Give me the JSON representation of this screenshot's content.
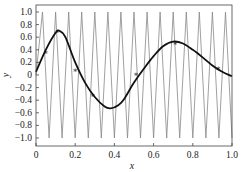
{
  "chart_data": {
    "type": "line",
    "title": "",
    "xlabel": "x",
    "ylabel": "y",
    "xlim": [
      0,
      1.0
    ],
    "ylim": [
      -1.1,
      1.1
    ],
    "grid": false,
    "legend": null,
    "xticks": [
      "0",
      "0.2",
      "0.4",
      "0.6",
      "0.8",
      "1.0"
    ],
    "yticks": [
      "1.0",
      "0.8",
      "0.6",
      "0.4",
      "0.2",
      "0",
      "-0.2",
      "-0.4",
      "-0.6",
      "-0.8",
      "-1.0"
    ],
    "series": [
      {
        "name": "zigzag (gray)",
        "style": "thin gray line",
        "color": "#888888",
        "description": "triangle wave oscillating between -1 and 1, about 15 cycles over [0,1]",
        "cycles": 15,
        "amplitude": 1.0
      },
      {
        "name": "smooth curve (black)",
        "style": "thick black line",
        "color": "#111111",
        "x": [
          0.0,
          0.05,
          0.1,
          0.12,
          0.15,
          0.2,
          0.25,
          0.3,
          0.35,
          0.38,
          0.42,
          0.45,
          0.5,
          0.55,
          0.6,
          0.65,
          0.7,
          0.75,
          0.8,
          0.85,
          0.9,
          0.95,
          1.0
        ],
        "y": [
          0.05,
          0.4,
          0.67,
          0.7,
          0.6,
          0.2,
          -0.12,
          -0.35,
          -0.5,
          -0.53,
          -0.48,
          -0.38,
          -0.12,
          0.1,
          0.3,
          0.46,
          0.53,
          0.5,
          0.4,
          0.28,
          0.15,
          0.05,
          -0.02
        ]
      },
      {
        "name": "sample markers",
        "style": "star markers",
        "color": "#111111",
        "x": [
          0.05,
          0.11,
          0.2,
          0.29,
          0.51,
          0.71,
          0.93
        ],
        "y": [
          0.37,
          0.7,
          0.08,
          -0.32,
          0.02,
          0.51,
          0.11
        ]
      }
    ]
  },
  "labels": {
    "xlabel": "x",
    "ylabel": "y"
  }
}
